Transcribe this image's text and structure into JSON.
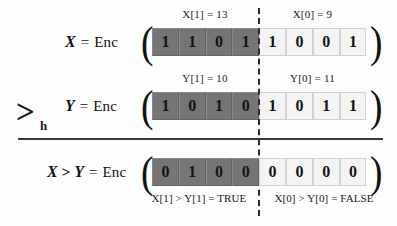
{
  "figure": {
    "operator": {
      "symbol": ">",
      "subscript": "h"
    },
    "background_color": "#fdfdfd",
    "dark_cell_color": "#757575",
    "light_cell_color": "#f4f4f4",
    "divider_color": "#2b2b2b"
  },
  "rows": [
    {
      "id": "row-x",
      "lhs_var": "X",
      "relation": "",
      "equals": "=",
      "enc": "Enc",
      "open_paren": "(",
      "close_paren": ")",
      "limb_high_label": "X[1] = 13",
      "limb_low_label": "X[0] = 9",
      "bits_high": [
        "1",
        "1",
        "0",
        "1"
      ],
      "bits_low": [
        "1",
        "0",
        "0",
        "1"
      ]
    },
    {
      "id": "row-y",
      "lhs_var": "Y",
      "relation": "",
      "equals": "=",
      "enc": "Enc",
      "open_paren": "(",
      "close_paren": ")",
      "limb_high_label": "Y[1] = 10",
      "limb_low_label": "Y[0] = 11",
      "bits_high": [
        "1",
        "0",
        "1",
        "0"
      ],
      "bits_low": [
        "1",
        "0",
        "1",
        "1"
      ]
    },
    {
      "id": "row-result",
      "lhs_var": "X",
      "relation": ">",
      "lhs_var2": "Y",
      "equals": "=",
      "enc": "Enc",
      "open_paren": "(",
      "close_paren": ")",
      "limb_high_label": "",
      "limb_low_label": "",
      "bits_high": [
        "0",
        "1",
        "0",
        "0"
      ],
      "bits_low": [
        "0",
        "0",
        "0",
        "0"
      ]
    }
  ],
  "conclusions": {
    "high": "X[1] > Y[1] = TRUE",
    "low": "X[0] > Y[0] = FALSE"
  }
}
